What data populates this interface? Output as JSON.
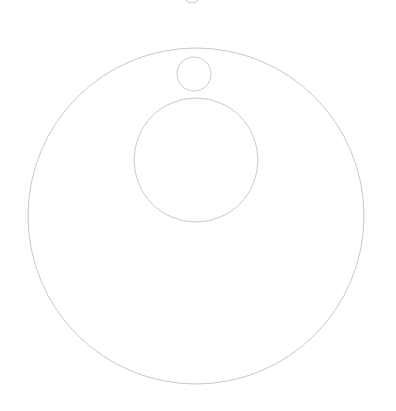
{
  "canvas": {
    "width": 396,
    "height": 411,
    "background": "#ffffff"
  },
  "style": {
    "stroke": "#c8c8c8",
    "stroke_width": 1
  },
  "circles": [
    {
      "name": "top-partial-circle",
      "cx": 192,
      "cy": -6,
      "r": 9
    },
    {
      "name": "large-outer-circle",
      "cx": 196,
      "cy": 216,
      "r": 168
    },
    {
      "name": "small-circle",
      "cx": 194,
      "cy": 74,
      "r": 17
    },
    {
      "name": "middle-circle",
      "cx": 196,
      "cy": 160,
      "r": 62
    }
  ]
}
